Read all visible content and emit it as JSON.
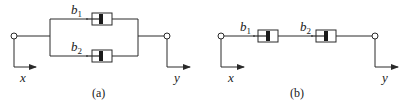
{
  "diagrams": [
    {
      "id": "a",
      "caption": "(a)",
      "configuration": "parallel",
      "input_label": "x",
      "output_label": "y",
      "dampers": [
        {
          "symbol": "b",
          "subscript": "1"
        },
        {
          "symbol": "b",
          "subscript": "2"
        }
      ]
    },
    {
      "id": "b",
      "caption": "(b)",
      "configuration": "series",
      "input_label": "x",
      "output_label": "y",
      "dampers": [
        {
          "symbol": "b",
          "subscript": "1"
        },
        {
          "symbol": "b",
          "subscript": "2"
        }
      ]
    }
  ],
  "colors": {
    "line": "#2a2a2a",
    "piston": "#1a1a1a",
    "background": "#ffffff"
  }
}
